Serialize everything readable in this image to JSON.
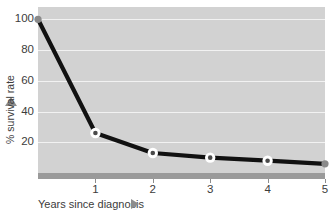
{
  "chart_data": {
    "type": "line",
    "title": "",
    "xlabel": "Years since diagnosis",
    "ylabel": "% survival rate",
    "x": [
      0,
      1,
      2,
      3,
      4,
      5
    ],
    "values": [
      100,
      26,
      13,
      10,
      8,
      6
    ],
    "series": [
      {
        "name": "% survival rate",
        "x": [
          0,
          1,
          2,
          3,
          4,
          5
        ],
        "values": [
          100,
          26,
          13,
          10,
          8,
          6
        ]
      }
    ],
    "xlim": [
      0,
      5
    ],
    "ylim": [
      0,
      108
    ],
    "xticks": [
      "1",
      "2",
      "3",
      "4",
      "5"
    ],
    "xtick_values": [
      1,
      2,
      3,
      4,
      5
    ],
    "yticks": [
      "20",
      "40",
      "60",
      "80",
      "100"
    ],
    "ytick_values": [
      20,
      40,
      60,
      80,
      100
    ],
    "grid": true,
    "legend": false,
    "legend_position": "none",
    "colors": {
      "plot_background": "#d2d2d2",
      "grid_line": "#f2f2f2",
      "line": "#111111",
      "marker_fill": "#ffffff",
      "marker_center": "#4a4a4a",
      "axis_bar": "#9a9a9a",
      "arrow": "#8d8d8d",
      "text": "#3c3c3c",
      "page_background": "#ffffff"
    }
  },
  "axes": {
    "y_title": "% survival rate",
    "y_arrow_icon": "triangle-up-icon",
    "x_title": "Years since diagnosis",
    "x_arrow_icon": "triangle-right-icon"
  }
}
